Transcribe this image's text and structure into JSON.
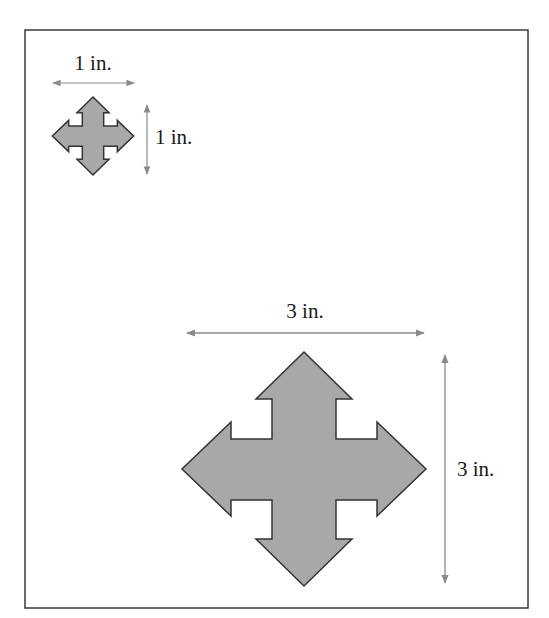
{
  "figure": {
    "frame": {
      "stroke": "#3a3a3a"
    },
    "small_arrow": {
      "width_label": "1 in.",
      "height_label": "1 in.",
      "fill": "#a8a8a8",
      "stroke": "#333333",
      "icon": "four-way-arrow-icon"
    },
    "large_arrow": {
      "width_label": "3 in.",
      "height_label": "3 in.",
      "fill": "#a8a8a8",
      "stroke": "#333333",
      "icon": "four-way-arrow-icon"
    },
    "dimension_line_color": "#8a8a8a"
  }
}
